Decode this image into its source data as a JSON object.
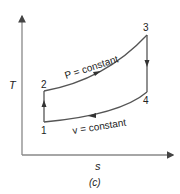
{
  "diagram": {
    "type": "T-s diagram (thermodynamic cycle)",
    "caption": "(c)",
    "axes": {
      "y_label": "T",
      "x_label": "s"
    },
    "states": [
      {
        "id": "1",
        "label": "1"
      },
      {
        "id": "2",
        "label": "2"
      },
      {
        "id": "3",
        "label": "3"
      },
      {
        "id": "4",
        "label": "4"
      }
    ],
    "processes": [
      {
        "from": "1",
        "to": "2",
        "kind": "vertical",
        "label": ""
      },
      {
        "from": "2",
        "to": "3",
        "kind": "curve",
        "label": "P = constant"
      },
      {
        "from": "3",
        "to": "4",
        "kind": "vertical",
        "label": ""
      },
      {
        "from": "4",
        "to": "1",
        "kind": "curve",
        "label": "v = constant"
      }
    ],
    "colors": {
      "line": "#555555",
      "axis": "#777777",
      "text": "#222222"
    }
  }
}
